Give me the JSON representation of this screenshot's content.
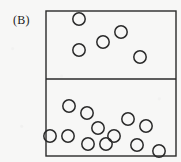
{
  "figure": {
    "label": "(B)",
    "background_color": "#f7f7f6",
    "stroke_color": "#2a2a2a"
  },
  "chart_data": {
    "type": "scatter",
    "title": "(B)",
    "xlabel": "",
    "ylabel": "",
    "grid": false,
    "legend": null,
    "xlim": [
      46,
      176
    ],
    "ylim": [
      11,
      156
    ],
    "annotations": [],
    "frame": {
      "x": 46,
      "y": 11,
      "width": 130,
      "height": 145,
      "divider_y": 79,
      "stroke_width": 1.4
    },
    "marker": {
      "shape": "open-circle",
      "radius": 6.2,
      "stroke_width": 1.5,
      "fill": "none"
    },
    "series": [
      {
        "name": "top-compartment",
        "count": 5,
        "points": [
          {
            "x": 79,
            "y": 19
          },
          {
            "x": 121,
            "y": 32
          },
          {
            "x": 103,
            "y": 42
          },
          {
            "x": 79,
            "y": 50
          },
          {
            "x": 140,
            "y": 57
          }
        ]
      },
      {
        "name": "bottom-compartment",
        "count": 12,
        "points": [
          {
            "x": 69,
            "y": 106
          },
          {
            "x": 87,
            "y": 113
          },
          {
            "x": 128,
            "y": 119
          },
          {
            "x": 146,
            "y": 126
          },
          {
            "x": 98,
            "y": 128
          },
          {
            "x": 68,
            "y": 136
          },
          {
            "x": 114,
            "y": 136
          },
          {
            "x": 88,
            "y": 144
          },
          {
            "x": 137,
            "y": 145
          },
          {
            "x": 159,
            "y": 151
          },
          {
            "x": 106,
            "y": 144
          },
          {
            "x": 50,
            "y": 136
          }
        ]
      }
    ]
  }
}
